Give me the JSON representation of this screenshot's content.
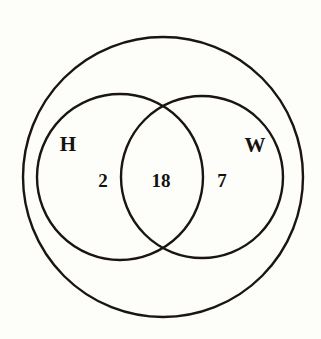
{
  "figure": {
    "type": "venn-diagram",
    "kind": "two-set-venn-with-universal-set",
    "background_color": "#fdfdfa",
    "ink_color": "#1a1510"
  },
  "sets": {
    "left": {
      "name": "set-h",
      "label": "H",
      "label_x": 68,
      "label_y": 151,
      "circle": {
        "cx": 120,
        "cy": 177,
        "r": 83
      }
    },
    "right": {
      "name": "set-w",
      "label": "W",
      "label_x": 255,
      "label_y": 152,
      "circle": {
        "cx": 202,
        "cy": 177,
        "r": 81
      }
    }
  },
  "universal_set": {
    "name": "universal-set",
    "circle": {
      "cx": 163,
      "cy": 177,
      "r": 140
    }
  },
  "regions": [
    {
      "name": "region-h-only",
      "label": "H only",
      "value": "2",
      "x": 103,
      "y": 187
    },
    {
      "name": "region-intersection",
      "label": "H and W",
      "value": "18",
      "x": 161,
      "y": 187
    },
    {
      "name": "region-w-only",
      "label": "W only",
      "value": "7",
      "x": 222,
      "y": 187
    }
  ],
  "chart_data": {
    "type": "venn",
    "title": "",
    "set_labels": [
      "H",
      "W"
    ],
    "regions": {
      "H_only": 2,
      "intersection": 18,
      "W_only": 7
    },
    "totals": {
      "H": 20,
      "W": 25,
      "union": 27
    },
    "has_universal_set_circle": true,
    "outside_value": null,
    "annotations": [
      "H",
      "W",
      "2",
      "18",
      "7"
    ]
  }
}
